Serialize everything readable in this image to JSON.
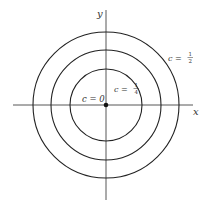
{
  "diagram": {
    "axes": {
      "x_label": "x",
      "y_label": "y"
    },
    "center": {
      "x": 106,
      "y": 105
    },
    "stroke_color": "#222222",
    "curves": [
      {
        "c_label": "c = 0",
        "c_text": "c = 0",
        "radius": 0,
        "type": "point"
      },
      {
        "c_label": "c = 1/4",
        "c_prefix": "c =",
        "numerator": "1",
        "denominator": "4",
        "radius": 36,
        "type": "circle"
      },
      {
        "c_label": "",
        "radius": 55,
        "type": "circle"
      },
      {
        "c_label": "c = 1/2",
        "c_prefix": "c =",
        "numerator": "1",
        "denominator": "2",
        "radius": 73,
        "type": "circle"
      }
    ]
  }
}
